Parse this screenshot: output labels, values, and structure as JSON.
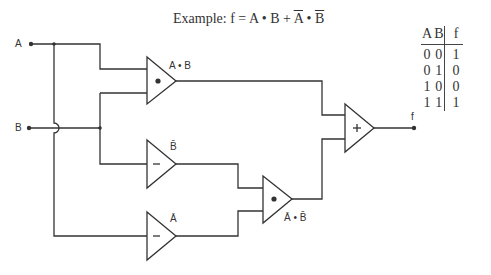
{
  "title": {
    "prefix": "Example: f = A • B + ",
    "notA": "A",
    "dot": " • ",
    "notB": "B"
  },
  "inputs": {
    "a": "A",
    "b": "B"
  },
  "output": {
    "f": "f"
  },
  "gates": [
    {
      "id": "and1",
      "symbol": "•",
      "label": "A • B"
    },
    {
      "id": "not_b",
      "symbol": "−",
      "label": "B̄"
    },
    {
      "id": "not_a",
      "symbol": "−",
      "label": "Ā"
    },
    {
      "id": "and2",
      "symbol": "•",
      "label": "Ā • B̄"
    },
    {
      "id": "or1",
      "symbol": "+",
      "label": ""
    }
  ],
  "truth_table": {
    "headers": [
      "A",
      "B",
      "f"
    ],
    "rows": [
      [
        "0",
        "0",
        "1"
      ],
      [
        "0",
        "1",
        "0"
      ],
      [
        "1",
        "0",
        "0"
      ],
      [
        "1",
        "1",
        "1"
      ]
    ]
  },
  "colors": {
    "line": "#333333",
    "background": "#ffffff"
  }
}
